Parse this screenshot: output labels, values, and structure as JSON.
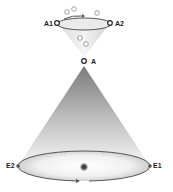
{
  "diagram": {
    "type": "cone-diagram",
    "upper_cone": {
      "orientation": "inverted",
      "rim_points": [
        {
          "id": "A1",
          "label": "A1"
        },
        {
          "id": "A2",
          "label": "A2"
        }
      ],
      "apex": {
        "id": "A",
        "label": "A"
      },
      "particles_count": 5,
      "rotation_arrow": "clockwise-top"
    },
    "lower_cone": {
      "orientation": "upright",
      "apex_shared_with": "A",
      "base_points": [
        {
          "id": "E1",
          "label": "E1"
        },
        {
          "id": "E2",
          "label": "E2"
        }
      ],
      "center_dot": true,
      "rotation_arrow": "bottom-rightward"
    },
    "colors": {
      "outline": "#555555",
      "fill_dark": "#9a9a9a",
      "fill_light": "#f5f5f5",
      "label": "#222222"
    }
  }
}
